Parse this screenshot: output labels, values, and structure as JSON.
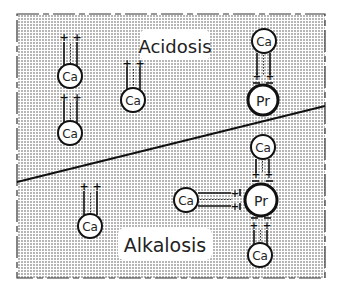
{
  "diagram": {
    "type": "schematic",
    "regions": [
      {
        "id": "acidosis",
        "label": "Acidosis"
      },
      {
        "id": "alkalosis",
        "label": "Alkalosis"
      }
    ],
    "nodes": {
      "calcium_label": "Ca",
      "protein_label": "Pr"
    },
    "acidosis": {
      "label": "Acidosis",
      "free_calcium_count": 3,
      "bound_calcium_count": 1
    },
    "alkalosis": {
      "label": "Alkalosis",
      "free_calcium_count": 1,
      "bound_calcium_count": 3
    },
    "colors": {
      "background": "#ffffff",
      "stipple": "#555555",
      "line": "#111111",
      "node_fill": "#ffffff"
    }
  }
}
